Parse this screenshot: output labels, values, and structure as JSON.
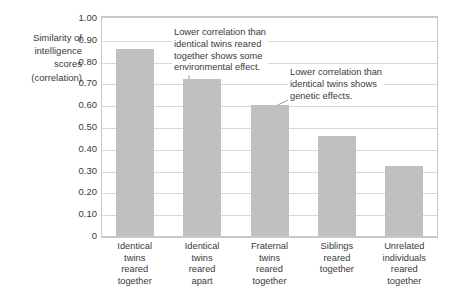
{
  "chart_data": {
    "type": "bar",
    "title": "",
    "subtitle": "",
    "xlabel": "",
    "ylabel": "Similarity of intelligence scores (correlation)",
    "ylim": [
      0,
      1.0
    ],
    "grid": true,
    "legend_position": "none",
    "categories": [
      "Identical twins reared together",
      "Identical twins reared apart",
      "Fraternal twins reared together",
      "Siblings reared together",
      "Unrelated individuals reared together"
    ],
    "values": [
      0.86,
      0.72,
      0.6,
      0.46,
      0.32
    ],
    "ytick_labels": [
      "1.00",
      "0.90",
      "0.80",
      "0.70",
      "0.60",
      "0.50",
      "0.40",
      "0.30",
      "0.20",
      "0.10",
      "0"
    ],
    "ytick_values": [
      1.0,
      0.9,
      0.8,
      0.7,
      0.6,
      0.5,
      0.4,
      0.3,
      0.2,
      0.1,
      0
    ],
    "bar_color": "#c0c0c0",
    "gridline_color": "#d8d8d8",
    "frame_color": "#c9c9c9",
    "text_color": "#3a3a3a",
    "annotations": [
      {
        "id": "annotation-1",
        "lines": [
          "Lower correlation than",
          "identical twins reared",
          "together shows some",
          "environmental effect."
        ],
        "points_to_category": "Identical twins reared apart",
        "points_to_value": 0.72
      },
      {
        "id": "annotation-2",
        "lines": [
          "Lower correlation than",
          "identical twins shows",
          "genetic effects."
        ],
        "points_to_category": "Fraternal twins reared together",
        "points_to_value": 0.6
      }
    ]
  },
  "y_axis_title_lines": [
    "Similarity of",
    "intelligence",
    "scores",
    "(correlation)"
  ]
}
